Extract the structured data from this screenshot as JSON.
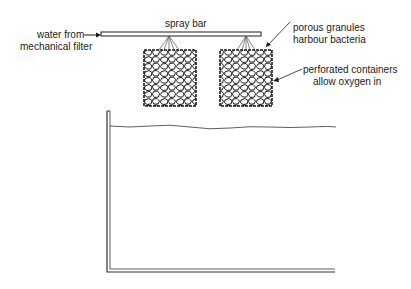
{
  "diagram": {
    "type": "aquarium trickle filter schematic",
    "labels": {
      "spray_bar": "spray bar",
      "water_in_line1": "water from",
      "water_in_line2": "mechanical filter",
      "granules_line1": "porous granules",
      "granules_line2": "harbour bacteria",
      "containers_line1": "perforated containers",
      "containers_line2": "allow oxygen in"
    },
    "components": [
      "spray bar",
      "left filter container",
      "right filter container",
      "water surface",
      "aquarium tank"
    ],
    "colors": {
      "ink": "#1a1a1a",
      "background": "#ffffff"
    }
  }
}
